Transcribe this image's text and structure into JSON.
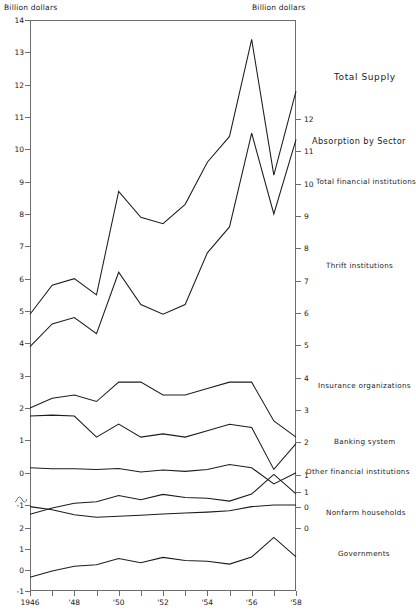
{
  "header": {
    "left_unit": "Billion dollars",
    "right_unit": "Billion dollars"
  },
  "axes": {
    "x_ticks": [
      "1946",
      "",
      "'48",
      "",
      "'50",
      "",
      "'52",
      "",
      "'54",
      "",
      "'56",
      "",
      "'58"
    ],
    "x_labels_shown": [
      "1946",
      "'48",
      "'50",
      "'52",
      "'54",
      "'56",
      "'58"
    ],
    "y_left_upper": [
      "14",
      "13",
      "12",
      "11",
      "10",
      "9",
      "8",
      "7",
      "6",
      "5",
      "4",
      "3",
      "2",
      "1",
      "0",
      "-1"
    ],
    "y_left_lower": [
      "2",
      "1",
      "0",
      "-1"
    ],
    "y_right_upper": [
      "12",
      "11",
      "10",
      "9",
      "8",
      "7",
      "6",
      "5",
      "4",
      "3",
      "2",
      "1",
      "0"
    ],
    "y_right_lower": [
      "1",
      "0"
    ],
    "break_marker": "axis-break-squiggle"
  },
  "annotations": [
    {
      "name": "total-supply",
      "text": "Total Supply"
    },
    {
      "name": "absorption-by-sector",
      "text": "Absorption by Sector"
    },
    {
      "name": "total-financial-institutions",
      "text": "Total financial institutions"
    },
    {
      "name": "thrift-institutions",
      "text": "Thrift institutions"
    },
    {
      "name": "insurance-organizations",
      "text": "Insurance organizations"
    },
    {
      "name": "banking-system",
      "text": "Banking system"
    },
    {
      "name": "other-financial-institutions",
      "text": "Other financial institutions"
    },
    {
      "name": "nonfarm-households",
      "text": "Nonfarm households"
    },
    {
      "name": "governments",
      "text": "Governments"
    }
  ],
  "chart_data": {
    "type": "line",
    "title": "",
    "xlabel": "",
    "ylabel": "Billion dollars",
    "x": [
      1946,
      1947,
      1948,
      1949,
      1950,
      1951,
      1952,
      1953,
      1954,
      1955,
      1956,
      1957,
      1958
    ],
    "xlim": [
      1946,
      1958
    ],
    "grid": false,
    "legend": "inline-right-labels",
    "note": "Left axis upper panel 14 to -1; lower panel (below axis break) 2 to -1. Right axis upper 12 to 0; lower 1 to 0.",
    "series": [
      {
        "name": "Total Supply",
        "ylabel_axis": "left-upper",
        "values": [
          4.9,
          5.8,
          6.0,
          5.5,
          8.7,
          7.9,
          7.7,
          8.3,
          9.6,
          10.4,
          13.4,
          9.2,
          11.8
        ],
        "ylim": [
          -1,
          14
        ]
      },
      {
        "name": "Absorption by Sector / Total financial institutions",
        "ylabel_axis": "left-upper",
        "values": [
          3.9,
          4.6,
          4.8,
          4.3,
          6.2,
          5.2,
          4.9,
          5.2,
          6.8,
          7.6,
          10.5,
          8.0,
          10.3
        ],
        "ylim": [
          -1,
          14
        ]
      },
      {
        "name": "Thrift institutions",
        "ylabel_axis": "left-upper",
        "values": [
          2.0,
          2.3,
          2.4,
          2.2,
          2.8,
          2.8,
          2.4,
          2.4,
          2.6,
          2.8,
          2.8,
          1.6,
          1.1
        ],
        "ylim": [
          -1,
          14
        ]
      },
      {
        "name": "Insurance organizations",
        "ylabel_axis": "left-upper",
        "values": [
          1.75,
          1.78,
          1.75,
          1.1,
          1.5,
          1.1,
          1.2,
          1.1,
          1.3,
          1.5,
          1.4,
          0.1,
          0.9
        ],
        "ylim": [
          -1,
          14
        ]
      },
      {
        "name": "Banking system",
        "ylabel_axis": "left-upper",
        "values": [
          0.15,
          0.12,
          0.12,
          0.1,
          0.13,
          0.02,
          0.08,
          0.04,
          0.1,
          0.25,
          0.15,
          -0.35,
          0.0
        ],
        "ylim": [
          -1,
          14
        ]
      },
      {
        "name": "Other financial institutions",
        "ylabel_axis": "left-upper",
        "values": [
          -1.05,
          -1.15,
          -1.3,
          -1.38,
          -1.35,
          -1.32,
          -1.28,
          -1.25,
          -1.22,
          -1.18,
          -1.05,
          -1.0,
          -1.0
        ],
        "ylim": [
          -1,
          14
        ]
      },
      {
        "name": "Nonfarm households",
        "ylabel_axis": "left-lower",
        "values": [
          -0.35,
          -0.05,
          0.18,
          0.25,
          0.55,
          0.35,
          0.6,
          0.45,
          0.42,
          0.28,
          0.62,
          1.55,
          0.62
        ],
        "ylim": [
          -1,
          2
        ]
      },
      {
        "name": "Governments",
        "ylabel_axis": "left-lower",
        "values": [
          -0.35,
          -0.05,
          0.18,
          0.25,
          0.55,
          0.35,
          0.6,
          0.45,
          0.42,
          0.28,
          0.62,
          1.55,
          0.62
        ],
        "ylim": [
          -1,
          2
        ]
      }
    ]
  }
}
